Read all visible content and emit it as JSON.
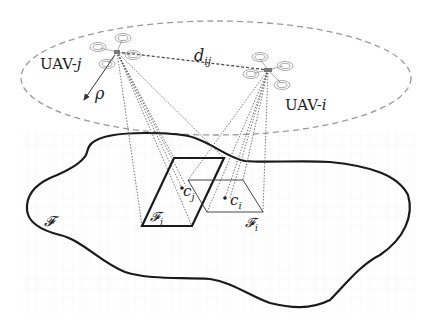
{
  "diagram": {
    "type": "uav-coverage-illustration",
    "colors": {
      "region_outline": "#1a1a1a",
      "ellipse_dash": "#9a9a9a",
      "projection_lines": "#555555",
      "grid": "#ececec",
      "text": "#222222"
    },
    "nodes": [
      {
        "id": "uav-j",
        "label_prefix": "UAV-",
        "label_index": "j",
        "icon": "quadcopter-icon"
      },
      {
        "id": "uav-i",
        "label_prefix": "UAV-",
        "label_index": "i",
        "icon": "quadcopter-icon"
      }
    ],
    "edges": [
      {
        "from": "uav-j",
        "to": "uav-i",
        "style": "dashed",
        "label_base": "d",
        "label_sub": "ij"
      },
      {
        "from": "uav-j",
        "to": "ellipse-boundary",
        "style": "arrow",
        "label": "ρ"
      }
    ],
    "regions": {
      "environment": {
        "label": "𝓕"
      },
      "fov_j": {
        "label_base": "𝓕",
        "label_sub": "j",
        "style": "thick"
      },
      "fov_i": {
        "label_base": "𝓕",
        "label_sub": "i",
        "style": "thin"
      }
    },
    "points": {
      "centroid_j": {
        "label_base": "c",
        "label_sub": "j"
      },
      "centroid_i": {
        "label_base": "c",
        "label_sub": "i"
      }
    }
  }
}
